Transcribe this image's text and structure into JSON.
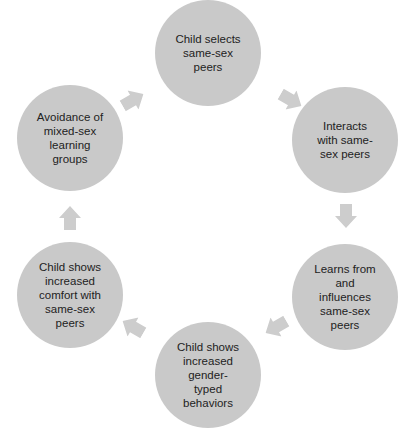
{
  "diagram": {
    "type": "cycle",
    "colors": {
      "node_fill": "#c9c9c9",
      "arrow_fill": "#cdcdcd",
      "text": "#222222",
      "background": "#ffffff"
    },
    "nodes": [
      {
        "id": "n1",
        "label": "Child selects\nsame-sex\npeers"
      },
      {
        "id": "n2",
        "label": "Interacts\nwith same-\nsex peers"
      },
      {
        "id": "n3",
        "label": "Learns from\nand\ninfluences\nsame-sex\npeers"
      },
      {
        "id": "n4",
        "label": "Child shows\nincreased\ngender-\ntyped\nbehaviors"
      },
      {
        "id": "n5",
        "label": "Child shows\nincreased\ncomfort with\nsame-sex\npeers"
      },
      {
        "id": "n6",
        "label": "Avoidance of\nmixed-sex\nlearning\ngroups"
      }
    ],
    "edges": [
      {
        "from": "n1",
        "to": "n2",
        "icon": "arrow-right-down-icon"
      },
      {
        "from": "n2",
        "to": "n3",
        "icon": "arrow-down-icon"
      },
      {
        "from": "n3",
        "to": "n4",
        "icon": "arrow-left-down-icon"
      },
      {
        "from": "n4",
        "to": "n5",
        "icon": "arrow-left-up-icon"
      },
      {
        "from": "n5",
        "to": "n6",
        "icon": "arrow-up-icon"
      },
      {
        "from": "n6",
        "to": "n1",
        "icon": "arrow-right-up-icon"
      }
    ]
  }
}
